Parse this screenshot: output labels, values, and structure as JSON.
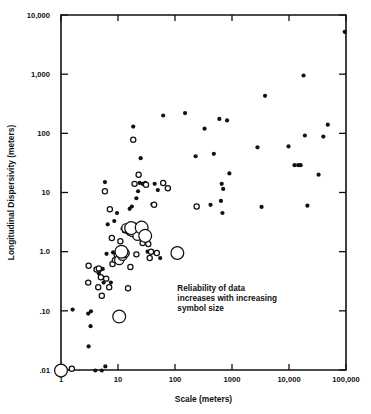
{
  "chart_data": {
    "type": "scatter",
    "title": "",
    "xlabel": "Scale (meters)",
    "ylabel": "Longitudinal Dispersivity (meters)",
    "xscale": "log",
    "yscale": "log",
    "xlim": [
      1,
      100000
    ],
    "ylim": [
      0.01,
      10000
    ],
    "grid": false,
    "legend_position": "none",
    "xticks": [
      1,
      10,
      100,
      1000,
      10000,
      100000
    ],
    "xticklabels": [
      "1",
      "10",
      "100",
      "1000",
      "10,000",
      "100,000"
    ],
    "yticks": [
      0.01,
      0.1,
      1.0,
      10,
      100,
      1000,
      10000
    ],
    "yticklabels": [
      ".01",
      ".10",
      "1.0",
      "10",
      "100",
      "1,000",
      "10,000"
    ],
    "annotations": [
      {
        "name": "reliability-note",
        "lines": [
          "Reliability of data",
          "increases with increasing",
          "symbol size"
        ],
        "x": 110,
        "y": 0.22
      }
    ],
    "symbol_encoding": {
      "description": "Reliability of data increases with increasing symbol size",
      "styles": [
        "filled-small",
        "open-small",
        "open-medium",
        "open-large"
      ]
    },
    "series": [
      {
        "name": "filled-small",
        "marker": "filled-circle",
        "radius_px": 2.1,
        "points": [
          [
            1.6,
            0.105
          ],
          [
            3.0,
            0.09
          ],
          [
            3.05,
            0.025
          ],
          [
            3.35,
            0.098
          ],
          [
            3.3,
            0.055
          ],
          [
            4.0,
            0.0098
          ],
          [
            4.6,
            0.43
          ],
          [
            4.8,
            0.48
          ],
          [
            5.2,
            0.0098
          ],
          [
            5.4,
            0.51
          ],
          [
            5.6,
            0.3
          ],
          [
            6.0,
            0.0115
          ],
          [
            5.9,
            15.0
          ],
          [
            6.3,
            0.92
          ],
          [
            6.6,
            2.9
          ],
          [
            7.5,
            0.3
          ],
          [
            8.2,
            0.97
          ],
          [
            8.6,
            3.3
          ],
          [
            9.6,
            4.5
          ],
          [
            10.5,
            0.65
          ],
          [
            11.5,
            0.68
          ],
          [
            12.0,
            2.45
          ],
          [
            12.8,
            2.2
          ],
          [
            13.5,
            2.3
          ],
          [
            14.5,
            2.1
          ],
          [
            15.5,
            2.0
          ],
          [
            16.0,
            5.3
          ],
          [
            17.5,
            5.8
          ],
          [
            18.5,
            130.0
          ],
          [
            20.5,
            1.95
          ],
          [
            21.0,
            8.0
          ],
          [
            22.5,
            10.5
          ],
          [
            24.0,
            14.5
          ],
          [
            25.0,
            38.0
          ],
          [
            26.0,
            2.1
          ],
          [
            27.0,
            14.0
          ],
          [
            30.0,
            14.5
          ],
          [
            33.0,
            1.0
          ],
          [
            40.0,
            6.3
          ],
          [
            44.0,
            14.0
          ],
          [
            50.0,
            11.0
          ],
          [
            55.0,
            0.78
          ],
          [
            62.0,
            200.0
          ],
          [
            72.0,
            12.0
          ],
          [
            150.0,
            220.0
          ],
          [
            230.0,
            41.0
          ],
          [
            330.0,
            120.0
          ],
          [
            420.0,
            6.2
          ],
          [
            480.0,
            45.0
          ],
          [
            600.0,
            175.0
          ],
          [
            640.0,
            7.2
          ],
          [
            660.0,
            14.0
          ],
          [
            680.0,
            4.5
          ],
          [
            700.0,
            11.5
          ],
          [
            820.0,
            165.0
          ],
          [
            900.0,
            21.0
          ],
          [
            2800.0,
            58.0
          ],
          [
            3300.0,
            5.7
          ],
          [
            3800.0,
            430.0
          ],
          [
            9800.0,
            60.0
          ],
          [
            12500.0,
            29.0
          ],
          [
            14500.0,
            29.0
          ],
          [
            16000.0,
            29.0
          ],
          [
            18000.0,
            950.0
          ],
          [
            19000.0,
            92.0
          ],
          [
            21000.0,
            6.0
          ],
          [
            33000.0,
            20.0
          ],
          [
            40000.0,
            88.0
          ],
          [
            48000.0,
            140.0
          ],
          [
            95000.0,
            5200.0
          ]
        ]
      },
      {
        "name": "open-small",
        "marker": "open-circle",
        "radius_px": 2.6,
        "points": [
          [
            1.55,
            0.0105
          ],
          [
            3.0,
            0.3
          ],
          [
            3.05,
            0.58
          ],
          [
            4.2,
            0.5
          ],
          [
            4.6,
            0.52
          ],
          [
            4.5,
            0.25
          ],
          [
            5.0,
            0.37
          ],
          [
            5.2,
            0.18
          ],
          [
            5.9,
            10.5
          ],
          [
            6.2,
            0.35
          ],
          [
            7.0,
            0.25
          ],
          [
            7.2,
            5.2
          ],
          [
            7.8,
            1.7
          ],
          [
            8.0,
            0.62
          ],
          [
            8.8,
            0.72
          ],
          [
            9.5,
            0.88
          ],
          [
            11.0,
            1.5
          ],
          [
            12.5,
            1.1
          ],
          [
            14.0,
            0.93
          ],
          [
            15.0,
            0.24
          ],
          [
            16.5,
            0.55
          ],
          [
            18.0,
            2.1
          ],
          [
            18.5,
            78.0
          ],
          [
            19.5,
            14.0
          ],
          [
            21.0,
            0.9
          ],
          [
            23.0,
            20.0
          ],
          [
            27.0,
            1.4
          ],
          [
            31.0,
            13.5
          ],
          [
            34.0,
            1.35
          ],
          [
            36.0,
            0.78
          ],
          [
            38.0,
            1.0
          ],
          [
            43.0,
            6.2
          ],
          [
            48.0,
            0.95
          ],
          [
            62.0,
            14.5
          ],
          [
            75.0,
            11.8
          ],
          [
            240.0,
            5.8
          ]
        ]
      },
      {
        "name": "open-medium",
        "marker": "open-circle",
        "radius_px": 4.6,
        "points": [
          [
            10.5,
            0.72
          ],
          [
            12.0,
            0.85
          ],
          [
            13.0,
            0.95
          ],
          [
            14.0,
            2.5
          ],
          [
            16.5,
            2.3
          ],
          [
            18.0,
            2.15
          ],
          [
            20.0,
            2.55
          ],
          [
            22.0,
            1.85
          ]
        ]
      },
      {
        "name": "open-large",
        "marker": "open-circle",
        "radius_px": 6.4,
        "points": [
          [
            1.0,
            0.0098
          ],
          [
            10.5,
            0.08
          ],
          [
            11.5,
            1.0
          ],
          [
            17.0,
            2.5
          ],
          [
            26.0,
            2.55
          ],
          [
            30.0,
            1.85
          ],
          [
            110.0,
            0.95
          ]
        ]
      }
    ]
  },
  "geometry": {
    "plot_left": 61,
    "plot_right": 346,
    "plot_top": 15,
    "plot_bottom": 370
  }
}
